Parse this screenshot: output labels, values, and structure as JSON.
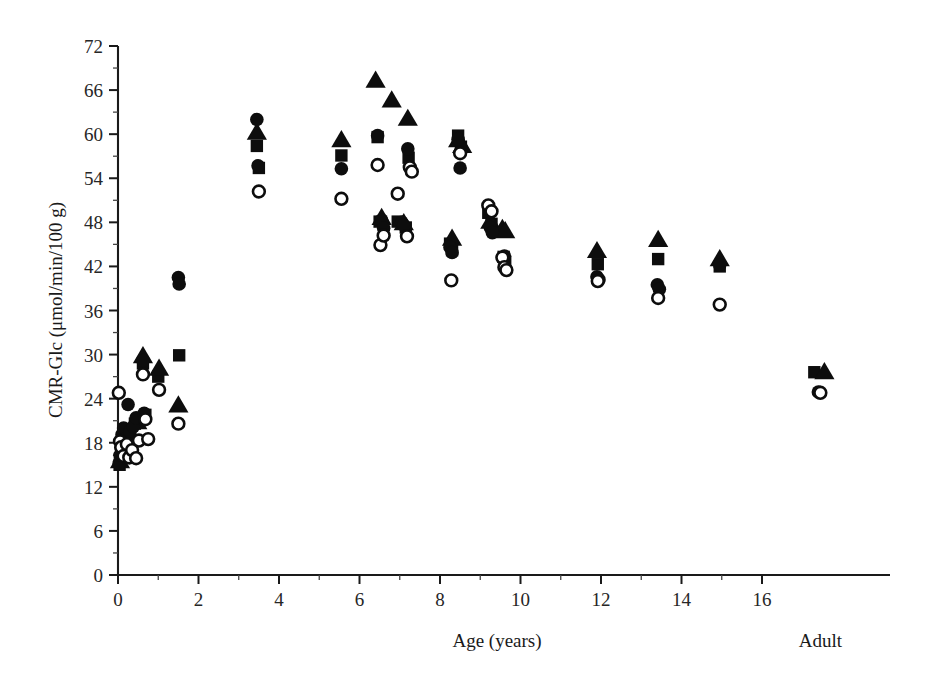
{
  "figure": {
    "background": "#ffffff",
    "marker_color": "#0d0d0d",
    "axis_color": "#1a1a1a"
  },
  "chart_data": {
    "type": "scatter",
    "title": "",
    "xlabel": "Age (years)",
    "ylabel": "CMR-Glc (μmol/min/100 g)",
    "xlim": [
      0,
      16
    ],
    "ylim": [
      0,
      72
    ],
    "xticks": [
      0,
      2,
      4,
      6,
      8,
      10,
      12,
      14,
      16
    ],
    "xtick_labels": [
      "0",
      "2",
      "4",
      "6",
      "8",
      "10",
      "12",
      "14",
      "16"
    ],
    "xminor_ticks": [
      1,
      3,
      5,
      7,
      9,
      11,
      13,
      15
    ],
    "yticks": [
      0,
      6,
      12,
      18,
      24,
      30,
      36,
      42,
      48,
      54,
      60,
      66,
      72
    ],
    "ytick_labels": [
      "0",
      "6",
      "12",
      "18",
      "24",
      "30",
      "36",
      "42",
      "48",
      "54",
      "60",
      "66",
      "72"
    ],
    "yminor_ticks": [
      3,
      9,
      15,
      21,
      27,
      33,
      39,
      45,
      51,
      57,
      63,
      69
    ],
    "grid": false,
    "legend": null,
    "extra_category_label": "Adult",
    "extra_category_x": 17.45,
    "marker_styles": {
      "filled-circle": "filled circle",
      "filled-square": "filled square",
      "filled-triangle": "filled triangle",
      "open-circle": "open circle"
    },
    "series": [
      {
        "name": "filled-circle",
        "marker": "filled-circle",
        "points": [
          [
            0.03,
            15.2
          ],
          [
            0.05,
            16.3
          ],
          [
            0.08,
            17.4
          ],
          [
            0.1,
            19.1
          ],
          [
            0.14,
            20.0
          ],
          [
            0.2,
            18.6
          ],
          [
            0.25,
            23.2
          ],
          [
            0.3,
            19.6
          ],
          [
            0.38,
            20.2
          ],
          [
            0.45,
            21.4
          ],
          [
            0.62,
            29.2
          ],
          [
            0.65,
            22.0
          ],
          [
            1.5,
            40.5
          ],
          [
            1.52,
            39.6
          ],
          [
            3.45,
            62.0
          ],
          [
            3.48,
            55.7
          ],
          [
            5.55,
            55.3
          ],
          [
            6.45,
            59.8
          ],
          [
            6.55,
            48.3
          ],
          [
            6.6,
            47.2
          ],
          [
            7.05,
            48.0
          ],
          [
            7.1,
            47.6
          ],
          [
            7.2,
            58.0
          ],
          [
            8.25,
            44.6
          ],
          [
            8.3,
            43.9
          ],
          [
            8.45,
            59.3
          ],
          [
            8.5,
            55.4
          ],
          [
            9.25,
            47.3
          ],
          [
            9.3,
            46.6
          ],
          [
            9.6,
            43.4
          ],
          [
            11.9,
            40.6
          ],
          [
            11.95,
            40.2
          ],
          [
            13.4,
            39.5
          ],
          [
            13.45,
            38.9
          ],
          [
            14.95,
            42.2
          ],
          [
            17.4,
            24.9
          ]
        ]
      },
      {
        "name": "filled-square",
        "marker": "filled-square",
        "points": [
          [
            0.04,
            15.0
          ],
          [
            0.09,
            16.8
          ],
          [
            0.18,
            18.0
          ],
          [
            0.28,
            19.8
          ],
          [
            0.42,
            20.6
          ],
          [
            0.62,
            28.8
          ],
          [
            0.68,
            21.8
          ],
          [
            1.0,
            27.0
          ],
          [
            1.52,
            29.9
          ],
          [
            3.45,
            58.4
          ],
          [
            3.5,
            55.4
          ],
          [
            5.55,
            57.1
          ],
          [
            6.45,
            59.6
          ],
          [
            6.5,
            48.1
          ],
          [
            6.95,
            48.1
          ],
          [
            7.15,
            47.3
          ],
          [
            7.22,
            56.8
          ],
          [
            8.25,
            45.1
          ],
          [
            8.3,
            44.2
          ],
          [
            8.45,
            59.8
          ],
          [
            8.52,
            58.3
          ],
          [
            9.2,
            49.3
          ],
          [
            9.28,
            47.8
          ],
          [
            9.58,
            43.3
          ],
          [
            9.62,
            42.6
          ],
          [
            11.92,
            42.3
          ],
          [
            13.42,
            43.0
          ],
          [
            14.95,
            42.0
          ],
          [
            17.3,
            27.6
          ]
        ]
      },
      {
        "name": "filled-triangle",
        "marker": "filled-triangle",
        "points": [
          [
            0.05,
            15.5
          ],
          [
            0.12,
            17.2
          ],
          [
            0.3,
            19.3
          ],
          [
            0.48,
            20.8
          ],
          [
            0.62,
            29.8
          ],
          [
            1.02,
            28.1
          ],
          [
            1.5,
            23.1
          ],
          [
            3.45,
            60.2
          ],
          [
            5.55,
            59.2
          ],
          [
            6.4,
            67.3
          ],
          [
            6.8,
            64.6
          ],
          [
            6.55,
            48.6
          ],
          [
            7.1,
            47.9
          ],
          [
            7.2,
            62.1
          ],
          [
            8.3,
            45.8
          ],
          [
            8.45,
            59.2
          ],
          [
            8.55,
            58.4
          ],
          [
            9.25,
            48.1
          ],
          [
            9.55,
            47.1
          ],
          [
            9.62,
            46.8
          ],
          [
            11.9,
            44.1
          ],
          [
            13.42,
            45.6
          ],
          [
            14.95,
            43.0
          ],
          [
            17.55,
            27.6
          ]
        ]
      },
      {
        "name": "open-circle",
        "marker": "open-circle",
        "points": [
          [
            0.02,
            24.8
          ],
          [
            0.05,
            18.2
          ],
          [
            0.08,
            17.4
          ],
          [
            0.14,
            16.2
          ],
          [
            0.22,
            17.8
          ],
          [
            0.28,
            16.0
          ],
          [
            0.35,
            17.0
          ],
          [
            0.45,
            15.9
          ],
          [
            0.52,
            18.3
          ],
          [
            0.62,
            27.3
          ],
          [
            0.68,
            21.2
          ],
          [
            0.75,
            18.5
          ],
          [
            1.02,
            25.2
          ],
          [
            1.5,
            20.6
          ],
          [
            3.5,
            52.2
          ],
          [
            5.55,
            51.2
          ],
          [
            6.45,
            55.8
          ],
          [
            6.52,
            44.9
          ],
          [
            6.6,
            46.2
          ],
          [
            6.95,
            51.9
          ],
          [
            7.18,
            46.1
          ],
          [
            7.25,
            55.5
          ],
          [
            7.3,
            54.9
          ],
          [
            8.28,
            40.1
          ],
          [
            8.5,
            57.4
          ],
          [
            9.2,
            50.3
          ],
          [
            9.28,
            49.5
          ],
          [
            9.55,
            43.2
          ],
          [
            9.6,
            41.9
          ],
          [
            9.65,
            41.5
          ],
          [
            11.92,
            40.0
          ],
          [
            13.42,
            37.7
          ],
          [
            14.95,
            36.8
          ],
          [
            17.45,
            24.8
          ]
        ]
      }
    ]
  }
}
